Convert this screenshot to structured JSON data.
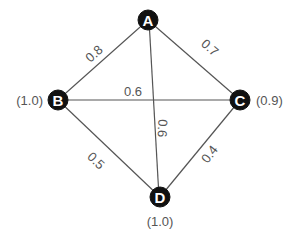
{
  "nodes": [
    {
      "id": "A",
      "label": "A",
      "value": ""
    },
    {
      "id": "B",
      "label": "B",
      "value": "(1.0)"
    },
    {
      "id": "C",
      "label": "C",
      "value": "(0.9)"
    },
    {
      "id": "D",
      "label": "D",
      "value": "(1.0)"
    }
  ],
  "edges": [
    {
      "from": "A",
      "to": "B",
      "weight": "0.8"
    },
    {
      "from": "A",
      "to": "C",
      "weight": "0.7"
    },
    {
      "from": "B",
      "to": "C",
      "weight": "0.6"
    },
    {
      "from": "A",
      "to": "D",
      "weight": "0.6"
    },
    {
      "from": "B",
      "to": "D",
      "weight": "0.5"
    },
    {
      "from": "C",
      "to": "D",
      "weight": "0.4"
    }
  ],
  "colors": {
    "node_fill": "#111111",
    "node_text": "#ffffff",
    "edge": "#555555",
    "label": "#555555"
  }
}
